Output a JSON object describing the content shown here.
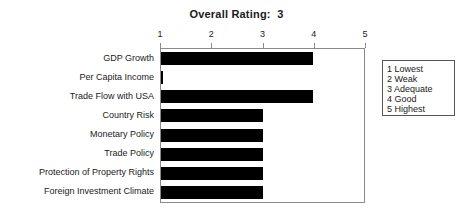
{
  "title": "Overall Rating:  3",
  "chart_data": {
    "type": "bar",
    "orientation": "horizontal",
    "title": "Overall Rating:  3",
    "xlabel": "",
    "ylabel": "",
    "xlim": [
      1,
      5
    ],
    "xticks": [
      1,
      2,
      3,
      4,
      5
    ],
    "xtick_labels": [
      "1",
      "2",
      "3",
      "4",
      "5"
    ],
    "grid": false,
    "legend_position": "right-outside",
    "bar_color": "#000000",
    "categories": [
      "GDP Growth",
      "Per Capita Income",
      "Trade Flow with USA",
      "Country Risk",
      "Monetary Policy",
      "Trade Policy",
      "Protection of Property Rights",
      "Foreign Investment Climate"
    ],
    "values": [
      4,
      1,
      4,
      3,
      3,
      3,
      3,
      3
    ]
  },
  "legend": {
    "entries": [
      "1 Lowest",
      "2 Weak",
      "3 Adequate",
      "4 Good",
      "5 Highest"
    ]
  }
}
